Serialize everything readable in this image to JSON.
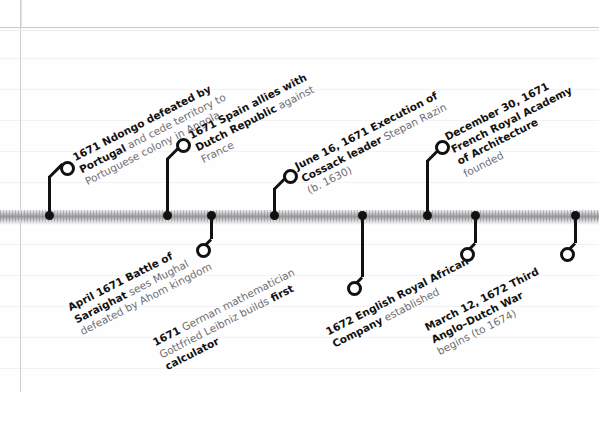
{
  "page": {
    "orientation": "horizontal",
    "axis_label": "timeline-axis"
  },
  "timeline": {
    "events": [
      {
        "id": "ndongo-portugal",
        "side": "above",
        "headline": "1671 Ndongo defeated by Portugal",
        "line1_bold": "1671 Ndongo defeated by",
        "line2_bold": "Portugal",
        "line2_rest": " and cede territory to",
        "line3_rest": "Portuguese colony in Angola"
      },
      {
        "id": "spain-dutch-alliance",
        "side": "above",
        "headline": "1671 Spain allies with Dutch Republic",
        "line1_bold": "1671 Spain allies with",
        "line2_bold": "Dutch Republic",
        "line2_rest": " against",
        "line3_rest": "France"
      },
      {
        "id": "stepan-razin-execution",
        "side": "above",
        "headline": "June 16, 1671 Execution of Cossack leader Stepan Razin",
        "line1_bold": "June 16, 1671 Execution of",
        "line2_bold": "Cossack leader",
        "line2_rest": " Stepan Razin",
        "line3_rest": "(b. 1630)"
      },
      {
        "id": "french-royal-academy-architecture",
        "side": "above",
        "headline": "December 30, 1671 French Royal Academy of Architecture founded",
        "line1_bold": "December 30, 1671",
        "line2_bold": "French Royal Academy",
        "line2_rest": "",
        "line3_bold": "of Architecture",
        "line4_rest": "founded"
      },
      {
        "id": "battle-of-saraighat",
        "side": "below",
        "headline": "April 1671 Battle of Saraighat",
        "line1_bold": "April 1671 Battle of",
        "line2_bold": "Saraighat",
        "line2_rest": " sees Mughal",
        "line3_rest": "defeated by Ahom kingdom"
      },
      {
        "id": "leibniz-calculator",
        "side": "below",
        "headline": "1671 German mathematician Gottfried Leibniz builds first calculator",
        "line1_bold": "1671",
        "line1_rest": " German mathematician",
        "line2_rest": "Gottfried Leibniz builds ",
        "line2_bold": "first",
        "line3_bold": "calculator"
      },
      {
        "id": "english-royal-african-company",
        "side": "below",
        "headline": "1672 English Royal African Company established",
        "line1_bold": "1672 English Royal African",
        "line2_bold": "Company",
        "line2_rest": " established"
      },
      {
        "id": "third-anglo-dutch-war",
        "side": "below",
        "headline": "March 12, 1672 Third Anglo–Dutch War begins (to 1674)",
        "line1_bold": "March 12, 1672 Third",
        "line2_bold": "Anglo–Dutch War",
        "line3_rest": "begins (to 1674)"
      }
    ]
  },
  "colors": {
    "ink": "#111111",
    "muted_text": "#6e6e74",
    "axis_dark": "#9b9ba0",
    "paper": "#ffffff",
    "rule": "#cfcfd4"
  }
}
